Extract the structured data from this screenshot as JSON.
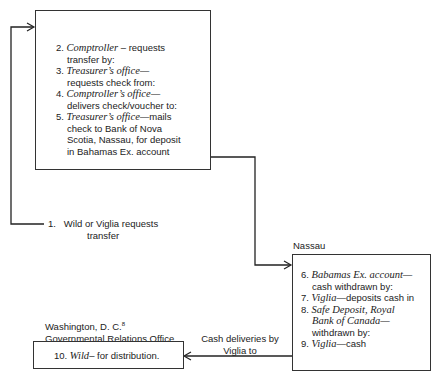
{
  "top_box": {
    "steps": [
      {
        "num": "2.",
        "actor": "Comptroller",
        "sep": " – requests",
        "rest": "transfer by:"
      },
      {
        "num": "3.",
        "actor": "Treasurer’s office",
        "sep": "—",
        "rest": "requests check from:"
      },
      {
        "num": "4.",
        "actor": "Comptroller’s office",
        "sep": "—",
        "rest": "delivers check/voucher to:"
      },
      {
        "num": "5.",
        "actor": "Treasurer’s office",
        "sep": "—mails",
        "rest": "check to Bank of Nova",
        "rest2": "Scotia, Nassau, for deposit",
        "rest3": "in Bahamas Ex. account"
      }
    ]
  },
  "step1": {
    "num": "1.",
    "line1": "Wild or Viglia requests",
    "line2": "transfer"
  },
  "nassau": {
    "label": "Nassau",
    "steps": [
      {
        "num": "6.",
        "actor": "Babamas Ex. account",
        "sep": "—",
        "rest": "cash withdrawn by:"
      },
      {
        "num": "7.",
        "actor": "Viglia",
        "sep": "—deposits cash in"
      },
      {
        "num": "8.",
        "actor": "Safe Deposit, Royal",
        "actor2": "Bank of Canada",
        "sep": "—",
        "rest": "withdrawn by:"
      },
      {
        "num": "9.",
        "actor": "Viglia",
        "sep": "—cash"
      }
    ]
  },
  "washington": {
    "label1": "Washington, D. C.",
    "footnote": "8",
    "label2": "Governmental Relations Office",
    "step": {
      "num": "10.",
      "actor": "Wild",
      "sep": "– for distribution."
    }
  },
  "cash_label": {
    "line1": "Cash deliveries by",
    "line2": "Viglia to"
  }
}
